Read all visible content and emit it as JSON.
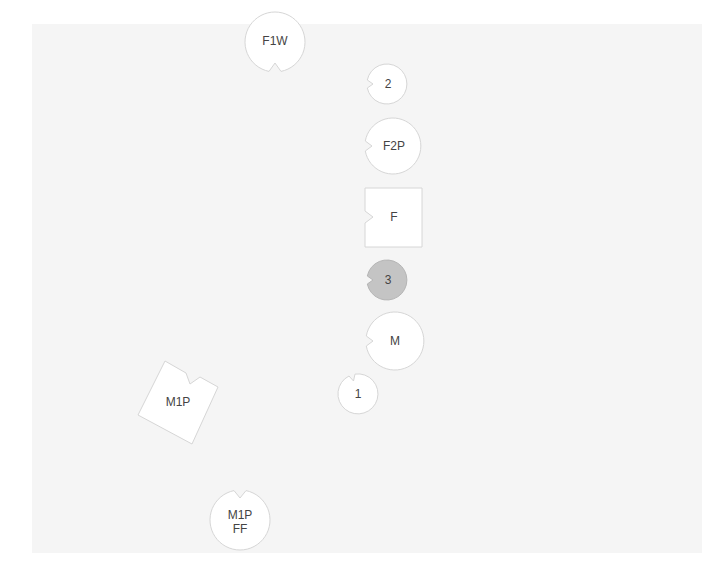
{
  "diagram": {
    "background_color": "#f5f5f5",
    "nodes": [
      {
        "id": "F1W",
        "label": "F1W",
        "shape": "circle",
        "notch": "bottom",
        "fill": "#ffffff"
      },
      {
        "id": "2",
        "label": "2",
        "shape": "circle",
        "notch": "left",
        "fill": "#ffffff"
      },
      {
        "id": "F2P",
        "label": "F2P",
        "shape": "circle",
        "notch": "left",
        "fill": "#ffffff"
      },
      {
        "id": "F",
        "label": "F",
        "shape": "square",
        "notch": "left",
        "fill": "#ffffff"
      },
      {
        "id": "3",
        "label": "3",
        "shape": "circle",
        "notch": "left",
        "fill": "#c4c4c4"
      },
      {
        "id": "M",
        "label": "M",
        "shape": "circle",
        "notch": "left",
        "fill": "#ffffff"
      },
      {
        "id": "1",
        "label": "1",
        "shape": "circle",
        "notch": "top-left",
        "fill": "#ffffff"
      },
      {
        "id": "M1P",
        "label": "M1P",
        "shape": "square-rotated",
        "notch": "top-right",
        "fill": "#ffffff"
      },
      {
        "id": "M1P FF",
        "label_line1": "M1P",
        "label_line2": "FF",
        "shape": "circle",
        "notch": "top",
        "fill": "#ffffff"
      }
    ]
  }
}
